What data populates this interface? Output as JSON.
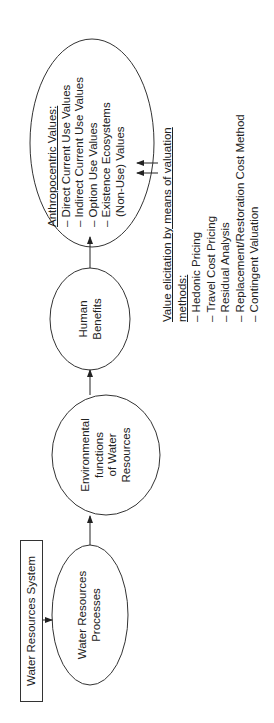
{
  "system_label": "Water Resources System",
  "nodes": {
    "processes": [
      "Water Resources",
      "Processes"
    ],
    "functions": [
      "Environmental",
      "functions",
      "of Water",
      "Resources"
    ],
    "benefits": [
      "Human",
      "Benefits"
    ],
    "values": {
      "title": "Anthropocentric Values:",
      "items": [
        "– Direct Current Use Values",
        "– Indirect Current Use Values",
        "– Option Use Values",
        "– Existence Ecosystems",
        "   (Non-Use) Values"
      ]
    }
  },
  "valuation": {
    "title_line1": "Value elicitation by means of valuation",
    "title_line2": "methods:",
    "methods": [
      "– Hedonic Pricing",
      "– Travel Cost Pricing",
      "– Residual Analysis",
      "– Replacement/Restoration Cost Method",
      "– Contingent Valuation"
    ]
  },
  "colors": {
    "line": "#333333",
    "text": "#222222",
    "background": "#ffffff"
  }
}
